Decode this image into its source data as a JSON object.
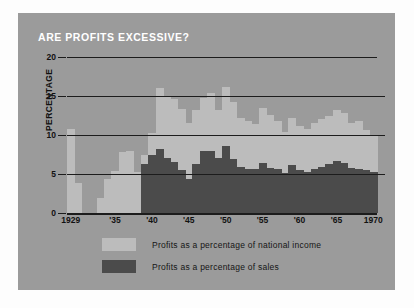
{
  "poster": {
    "title": "ARE PROFITS EXCESSIVE?",
    "background_color": "#9b9b9b",
    "title_color": "#ffffff"
  },
  "legend": {
    "position": "bottom-left",
    "items": [
      {
        "label": "Profits as a percentage of national income",
        "color": "#bcbcbc",
        "swatch_name": "national-income"
      },
      {
        "label": "Profits as a percentage of sales",
        "color": "#4b4b4b",
        "swatch_name": "sales"
      }
    ]
  },
  "chart_data": {
    "type": "bar",
    "title": "ARE PROFITS EXCESSIVE?",
    "xlabel": "",
    "ylabel": "PERCENTAGE",
    "ylim": [
      0,
      20
    ],
    "yticks": [
      0,
      5,
      10,
      15,
      20
    ],
    "ytick_labels": [
      "0",
      "5",
      "10",
      "15",
      "20"
    ],
    "grid": true,
    "xlim": [
      1929,
      1970
    ],
    "xtick_years": [
      1929,
      1935,
      1940,
      1945,
      1950,
      1955,
      1960,
      1965,
      1970
    ],
    "xtick_labels": [
      "1929",
      "'35",
      "'40",
      "'45",
      "'50",
      "'55",
      "'60",
      "'65",
      "1970"
    ],
    "x": [
      1929,
      1930,
      1931,
      1932,
      1933,
      1934,
      1935,
      1936,
      1937,
      1938,
      1939,
      1940,
      1941,
      1942,
      1943,
      1944,
      1945,
      1946,
      1947,
      1948,
      1949,
      1950,
      1951,
      1952,
      1953,
      1954,
      1955,
      1956,
      1957,
      1958,
      1959,
      1960,
      1961,
      1962,
      1963,
      1964,
      1965,
      1966,
      1967,
      1968,
      1969,
      1970
    ],
    "series": [
      {
        "name": "Profits as a percentage of national income",
        "color": "#bcbcbc",
        "values": [
          10.8,
          3.8,
          0,
          0,
          1.9,
          4.4,
          5.4,
          7.8,
          8.0,
          5.2,
          7.4,
          10.2,
          16.0,
          15.0,
          14.6,
          13.3,
          11.6,
          13.2,
          14.8,
          15.4,
          13.2,
          16.2,
          14.2,
          12.2,
          11.8,
          11.4,
          13.4,
          12.6,
          11.8,
          10.4,
          12.2,
          11.2,
          10.8,
          11.6,
          12.0,
          12.4,
          13.2,
          12.8,
          11.6,
          11.8,
          10.6,
          10.0
        ]
      },
      {
        "name": "Profits as a percentage of sales",
        "color": "#4b4b4b",
        "values": [
          0,
          0,
          0,
          0,
          0,
          0,
          0,
          0,
          0,
          0,
          6.3,
          7.4,
          8.2,
          7.0,
          6.6,
          5.5,
          4.3,
          6.3,
          7.9,
          8.0,
          7.0,
          8.6,
          6.9,
          5.9,
          5.6,
          5.6,
          6.4,
          5.8,
          5.6,
          5.1,
          6.2,
          5.5,
          5.3,
          5.6,
          5.9,
          6.3,
          6.7,
          6.4,
          5.8,
          5.7,
          5.5,
          5.2
        ]
      }
    ]
  }
}
